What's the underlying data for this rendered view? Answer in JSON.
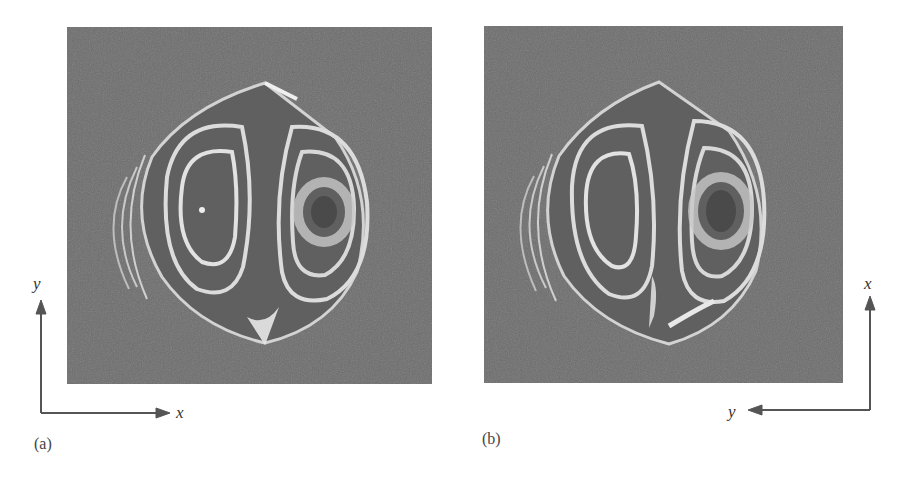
{
  "figure": {
    "panels": [
      {
        "id": "a",
        "label": "(a)",
        "axis_vertical": "y",
        "axis_horizontal": "x",
        "description": "interference fringe pattern, two lobes with closed fringes"
      },
      {
        "id": "b",
        "label": "(b)",
        "axis_vertical": "x",
        "axis_horizontal": "y",
        "description": "interference fringe pattern, two lobes with closed fringes (rotated axes)"
      }
    ],
    "colors": {
      "background": "#6e6e6e",
      "fringe": "#e6e6e6",
      "axis": "#555555"
    }
  }
}
